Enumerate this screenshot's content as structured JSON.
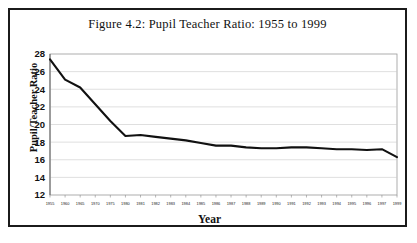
{
  "figure": {
    "title": "Figure 4.2: Pupil Teacher Ratio: 1955 to 1999",
    "border_color": "#1b1b1b",
    "background": "#ffffff"
  },
  "chart_data": {
    "type": "line",
    "title": "Figure 4.2: Pupil Teacher Ratio: 1955 to 1999",
    "xlabel": "Year",
    "ylabel": "Pupil/Teacher Ratio",
    "ylim": [
      12,
      28
    ],
    "ytick_step": 2,
    "yticks": [
      28,
      26,
      24,
      22,
      20,
      18,
      16,
      14,
      12
    ],
    "grid": true,
    "grid_axis": "y",
    "legend": "none",
    "line_color": "#111111",
    "categories": [
      "1955",
      "1960",
      "1965",
      "1970",
      "1975",
      "1980",
      "1981",
      "1982",
      "1983",
      "1984",
      "1985",
      "1986",
      "1987",
      "1988",
      "1989",
      "1990",
      "1991",
      "1992",
      "1993",
      "1994",
      "1995",
      "1996",
      "1997",
      "1999"
    ],
    "values": [
      27.4,
      25.1,
      24.2,
      22.3,
      20.4,
      18.7,
      18.8,
      18.6,
      18.4,
      18.2,
      17.9,
      17.6,
      17.6,
      17.4,
      17.3,
      17.3,
      17.4,
      17.4,
      17.3,
      17.2,
      17.2,
      17.1,
      17.2,
      16.3
    ],
    "series": [
      {
        "name": "Pupil/Teacher Ratio",
        "values": [
          27.4,
          25.1,
          24.2,
          22.3,
          20.4,
          18.7,
          18.8,
          18.6,
          18.4,
          18.2,
          17.9,
          17.6,
          17.6,
          17.4,
          17.3,
          17.3,
          17.4,
          17.4,
          17.3,
          17.2,
          17.2,
          17.1,
          17.2,
          16.3
        ]
      }
    ]
  }
}
